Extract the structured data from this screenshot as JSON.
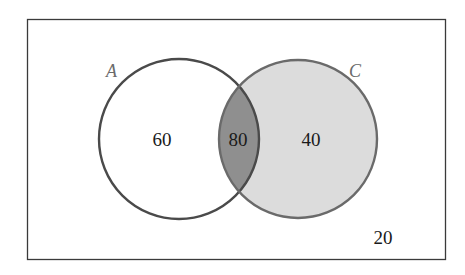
{
  "diagram": {
    "type": "venn",
    "universe": {
      "outside_value": "20"
    },
    "sets": [
      {
        "label": "A",
        "only_value": "60",
        "fill": "#ffffff",
        "stroke": "#4a4a4a"
      },
      {
        "label": "C",
        "only_value": "40",
        "fill": "#dcdcdc",
        "stroke": "#6a6a6a"
      }
    ],
    "intersection": {
      "value": "80",
      "fill": "#8f8f8f"
    }
  }
}
